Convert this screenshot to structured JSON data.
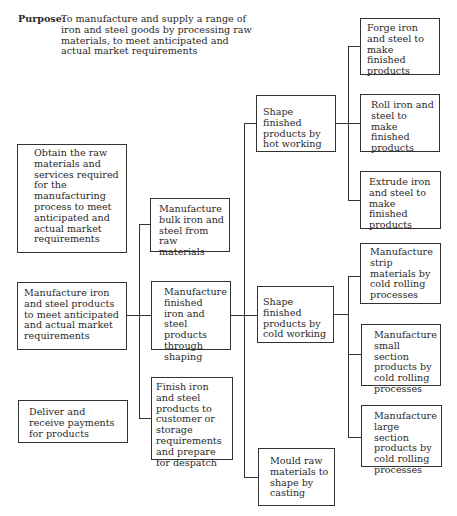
{
  "purpose": {
    "label": "Purpose:",
    "text": "To manufacture and supply a range of iron and steel goods by processing raw materials, to meet anticipated and actual market requirements"
  },
  "level1": [
    {
      "id": "obtain",
      "text": "Obtain the raw materials and services required for the manufacturing process to meet anticipated and actual market requirements"
    },
    {
      "id": "manufacture-products",
      "text": "Manufacture iron and steel products to meet anticipated and actual market requirements"
    },
    {
      "id": "deliver",
      "text": "Deliver and receive payments for products"
    }
  ],
  "level2": [
    {
      "id": "bulk",
      "text": "Manufacture bulk iron and steel from raw materials"
    },
    {
      "id": "finished-shaping",
      "text": "Manufacture finished iron and steel products through shaping"
    },
    {
      "id": "finish-despatch",
      "text": "Finish iron and steel products to customer or storage requirements and prepare for despatch"
    }
  ],
  "level3": [
    {
      "id": "hot-working",
      "text": "Shape finished products by hot working"
    },
    {
      "id": "cold-working",
      "text": "Shape finished products by cold working"
    },
    {
      "id": "casting",
      "text": "Mould raw materials to shape by casting"
    }
  ],
  "level4_hot": [
    {
      "id": "forge",
      "text": "Forge iron and steel to make finished products"
    },
    {
      "id": "roll",
      "text": "Roll iron and steel to make finished products"
    },
    {
      "id": "extrude",
      "text": "Extrude iron and steel to make finished products"
    }
  ],
  "level4_cold": [
    {
      "id": "strip",
      "text": "Manufacture strip materials by cold rolling processes"
    },
    {
      "id": "small-section",
      "text": "Manufacture small section products by cold rolling processes"
    },
    {
      "id": "large-section",
      "text": "Manufacture large section products by cold rolling processes"
    }
  ]
}
